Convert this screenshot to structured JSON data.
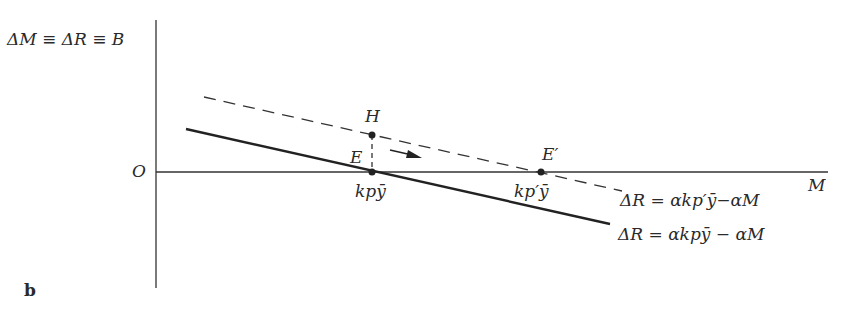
{
  "figure": {
    "panel_label": "b",
    "y_axis_label": "ΔM ≡ ΔR ≡ B",
    "x_axis_label": "M",
    "origin_label": "O"
  },
  "points": {
    "E": {
      "label": "E",
      "x_label": "kpȳ"
    },
    "H": {
      "label": "H"
    },
    "E_prime": {
      "label": "E′",
      "x_label": "kp′ȳ"
    }
  },
  "lines": {
    "original": {
      "style": "solid",
      "equation": "ΔR = αkpȳ − αM"
    },
    "shifted": {
      "style": "dashed",
      "equation": "ΔR = αkp′ȳ−αM"
    }
  },
  "colors": {
    "ink": "#2a2a2a",
    "background": "#ffffff"
  }
}
